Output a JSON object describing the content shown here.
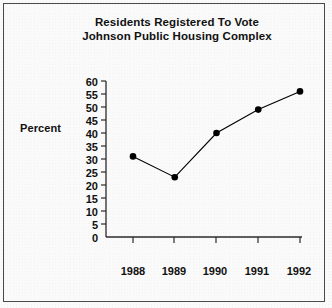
{
  "chart_data": {
    "type": "line",
    "title": "Residents Registered To Vote\nJohnson Public Housing Complex",
    "title_lines": [
      "Residents Registered To Vote",
      "Johnson Public Housing Complex"
    ],
    "xlabel": "",
    "ylabel": "Percent",
    "categories": [
      "1988",
      "1989",
      "1990",
      "1991",
      "1992"
    ],
    "values": [
      31,
      23,
      40,
      49,
      56
    ],
    "series": [
      {
        "name": "Percent Registered",
        "values": [
          31,
          23,
          40,
          49,
          56
        ]
      }
    ],
    "ylim": [
      0,
      60
    ],
    "ytick_step": 5,
    "ytick_labels": [
      "60",
      "55",
      "50",
      "45",
      "40",
      "35",
      "30",
      "25",
      "20",
      "15",
      "10",
      "5",
      "0"
    ],
    "xtick_labels": [
      "1988",
      "1989",
      "1990",
      "1991",
      "1992"
    ],
    "grid": false,
    "legend": false,
    "legend_position": "none",
    "marker": "filled-circle",
    "line_color": "#000000",
    "marker_color": "#000000",
    "axis_color": "#2b2b2b",
    "background_color": "#fafafa",
    "border_color": "#4a4a4a",
    "text_color": "#111111"
  }
}
